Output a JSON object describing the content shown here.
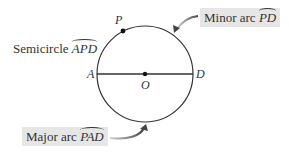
{
  "diagram": {
    "type": "circle-arcs",
    "circle": {
      "center": "O",
      "points_on_circle": [
        "P",
        "A",
        "D"
      ],
      "diameter": "AD"
    },
    "points": {
      "P": "P",
      "A": "A",
      "D": "D",
      "O": "O"
    },
    "labels": {
      "semicircle": {
        "text": "Semicircle ",
        "arc": "APD"
      },
      "minor_arc": {
        "text": "Minor arc ",
        "arc": "PD"
      },
      "major_arc": {
        "text": "Major arc ",
        "arc": "PAD"
      }
    },
    "colors": {
      "line": "#333333",
      "label_box": "#e6e6e6",
      "arrow": "#555555"
    }
  }
}
